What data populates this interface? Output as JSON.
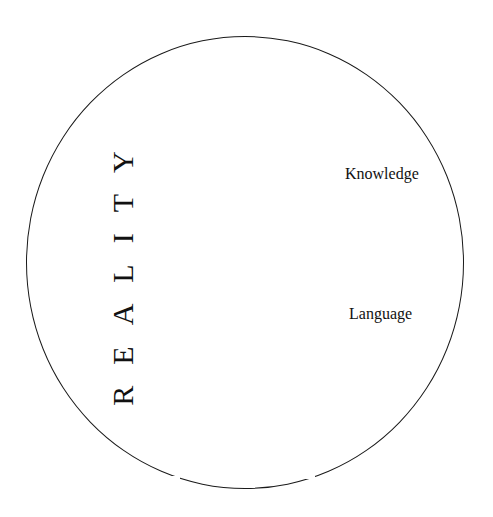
{
  "diagram": {
    "outer_circle_label": "REALITY",
    "outer_circle_label_spaced": "R E A L I T Y",
    "inner_labels": [
      {
        "id": "knowledge",
        "text": "Knowledge"
      },
      {
        "id": "language",
        "text": "Language"
      }
    ],
    "colors": {
      "background": "#ffffff",
      "stroke": "#1a1a1a",
      "text": "#111111"
    }
  }
}
